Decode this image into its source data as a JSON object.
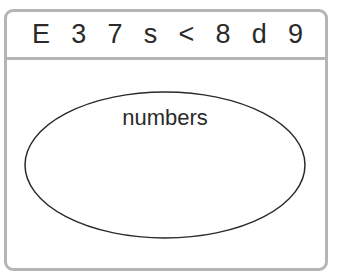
{
  "header": {
    "symbols": [
      "E",
      "3",
      "7",
      "s",
      "<",
      "8",
      "d",
      "9"
    ]
  },
  "diagram": {
    "set_label": "numbers",
    "ellipse": {
      "cx": 165,
      "cy": 165,
      "rx": 140,
      "ry": 73
    },
    "colors": {
      "frame_border": "#b5b5b5",
      "ellipse_stroke": "#2a2a2a",
      "text": "#2a2a2a"
    }
  }
}
